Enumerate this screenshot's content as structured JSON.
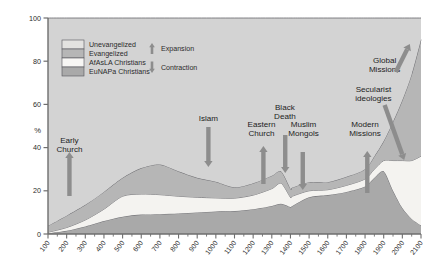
{
  "chart_data": {
    "type": "area",
    "title": "",
    "xlabel": "",
    "ylabel": "%",
    "ylim": [
      0,
      100
    ],
    "xlim": [
      100,
      2100
    ],
    "grid": false,
    "stacked": true,
    "legend_position": "top-left",
    "x": [
      100,
      200,
      300,
      400,
      500,
      600,
      700,
      800,
      900,
      1000,
      1100,
      1200,
      1300,
      1350,
      1400,
      1410,
      1500,
      1600,
      1700,
      1800,
      1850,
      1900,
      1950,
      2000,
      2050,
      2100
    ],
    "ytick_labels": [
      "0",
      "20",
      "40",
      "60",
      "80",
      "100"
    ],
    "ytick_values": [
      0,
      20,
      40,
      60,
      80,
      100
    ],
    "xtick_labels": [
      "100",
      "200",
      "300",
      "400",
      "500",
      "600",
      "700",
      "800",
      "900",
      "1000",
      "1100",
      "1200",
      "1300",
      "1400",
      "1500",
      "1600",
      "1700",
      "1800",
      "1900",
      "2000",
      "2100"
    ],
    "series": [
      {
        "name": "EuNAPa Christians",
        "color": "#a9a9a9",
        "values": [
          0.3,
          1.5,
          3.5,
          6.0,
          8.0,
          9.0,
          9.2,
          9.5,
          10.0,
          10.4,
          10.6,
          11.5,
          13.0,
          14.0,
          12.5,
          13.0,
          17.0,
          18.0,
          19.5,
          22.0,
          26.0,
          29.0,
          20.0,
          12.0,
          7.0,
          4.0
        ]
      },
      {
        "name": "AfAsLA Christians",
        "color": "#f4f3f0",
        "values": [
          0.5,
          1.5,
          3.0,
          5.5,
          9.5,
          9.5,
          9.0,
          8.0,
          7.0,
          6.3,
          6.0,
          6.5,
          8.0,
          9.5,
          4.5,
          4.5,
          3.0,
          2.5,
          3.0,
          3.5,
          4.0,
          5.0,
          14.0,
          22.0,
          27.0,
          32.0
        ]
      },
      {
        "name": "Evangelized",
        "color": "#b6b6b6",
        "values": [
          3.0,
          5.5,
          7.0,
          8.0,
          8.5,
          12.0,
          14.0,
          11.5,
          9.0,
          7.5,
          5.0,
          5.5,
          6.0,
          5.5,
          4.0,
          4.0,
          4.0,
          3.5,
          4.0,
          4.5,
          6.0,
          9.0,
          18.0,
          28.0,
          40.0,
          54.0
        ]
      },
      {
        "name": "Unevangelized",
        "color": "#d3d3d3",
        "values": [
          96.2,
          91.5,
          86.5,
          80.5,
          74.0,
          69.5,
          67.8,
          71.0,
          74.0,
          75.8,
          78.4,
          76.5,
          73.0,
          71.0,
          79.0,
          78.5,
          76.0,
          76.0,
          73.5,
          70.0,
          64.0,
          57.0,
          48.0,
          38.0,
          26.0,
          10.0
        ]
      }
    ],
    "annotations": [
      {
        "label": "Early Church",
        "x": 200,
        "direction": "up"
      },
      {
        "label": "Islam",
        "x": 950,
        "direction": "down"
      },
      {
        "label": "Eastern Church",
        "x": 1250,
        "direction": "up"
      },
      {
        "label": "Black Death",
        "x": 1370,
        "direction": "down"
      },
      {
        "label": "Muslim Mongols",
        "x": 1450,
        "direction": "down"
      },
      {
        "label": "Modern Missions",
        "x": 1820,
        "direction": "up"
      },
      {
        "label": "Secularist ideologies",
        "x": 1980,
        "direction": "down-right"
      },
      {
        "label": "Global Missions",
        "x": 2030,
        "direction": "up-right"
      }
    ]
  },
  "legend": {
    "items": [
      {
        "label": "Unevangelized",
        "color": "#e3e2e0"
      },
      {
        "label": "Evangelized",
        "color": "#b6b6b6"
      },
      {
        "label": "AfAsLA Christians",
        "color": "#f7f6f4"
      },
      {
        "label": "EuNAPa Christians",
        "color": "#a9a9a9"
      }
    ],
    "markers": [
      {
        "label": "Expansion",
        "arrow": "up"
      },
      {
        "label": "Contraction",
        "arrow": "down"
      }
    ]
  },
  "axis": {
    "y_unit": "%",
    "arrow_color": "#8d8d8d",
    "plot_bg": "#d3d3d3",
    "axis_color": "#6e6e6e",
    "line_color": "#55555a"
  }
}
